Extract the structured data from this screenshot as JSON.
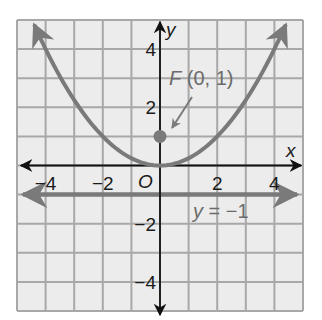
{
  "chart_data": {
    "type": "line",
    "title": "",
    "xlabel": "x",
    "ylabel": "y",
    "xlim": [
      -5,
      5
    ],
    "ylim": [
      -5,
      5
    ],
    "grid": true,
    "origin_label": "O",
    "x_ticks": [
      {
        "value": -4,
        "label": "−4"
      },
      {
        "value": -2,
        "label": "−2"
      },
      {
        "value": 2,
        "label": "2"
      },
      {
        "value": 4,
        "label": "4"
      }
    ],
    "y_ticks": [
      {
        "value": 4,
        "label": "4"
      },
      {
        "value": 2,
        "label": "2"
      },
      {
        "value": -2,
        "label": "−2"
      },
      {
        "value": -4,
        "label": "−4"
      }
    ],
    "series": [
      {
        "name": "parabola",
        "equation": "y = x^2 / 4",
        "x": [
          -4.4,
          -4,
          -3,
          -2,
          -1,
          0,
          1,
          2,
          3,
          4,
          4.4
        ],
        "y": [
          4.84,
          4,
          2.25,
          1,
          0.25,
          0,
          0.25,
          1,
          2.25,
          4,
          4.84
        ],
        "color": "#7a7a7a",
        "arrows": "both ends"
      },
      {
        "name": "directrix",
        "label": "y = −1",
        "x": [
          -5,
          5
        ],
        "y": [
          -1,
          -1
        ],
        "color": "#7a7a7a",
        "arrows": "both ends"
      }
    ],
    "points": [
      {
        "name": "focus",
        "label": "F (0, 1)",
        "x": 0,
        "y": 1,
        "color": "#7a7a7a"
      }
    ],
    "annotations": [
      {
        "text": "F (0, 1)",
        "target": "focus",
        "arrow": true
      },
      {
        "text": "y = −1",
        "target": "directrix"
      }
    ]
  },
  "labels": {
    "x_axis": "x",
    "y_axis": "y",
    "origin": "O",
    "focus_letter": "F",
    "focus_coords": " (0, 1)",
    "directrix_y": "y",
    "directrix_rest": " = −1"
  },
  "colors": {
    "grid_fill": "#ececec",
    "grid_line": "#a8a8a8",
    "axis": "#111111",
    "curve": "#7a7a7a"
  }
}
